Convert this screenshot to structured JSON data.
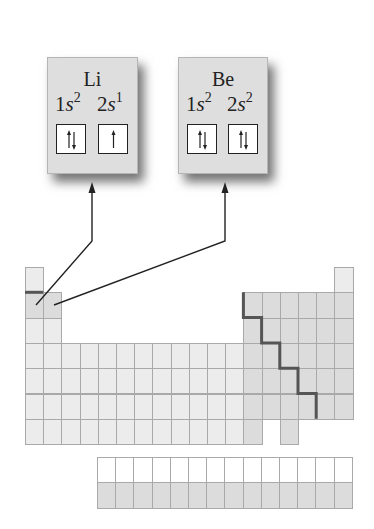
{
  "diagram": {
    "elements": [
      {
        "symbol": "Li",
        "orbitals": [
          {
            "label_n": "1",
            "label_l": "s",
            "electrons": "2",
            "spins": "up-down"
          },
          {
            "label_n": "2",
            "label_l": "s",
            "electrons": "1",
            "spins": "up"
          }
        ],
        "table_position": {
          "period": 2,
          "group": 1
        }
      },
      {
        "symbol": "Be",
        "orbitals": [
          {
            "label_n": "1",
            "label_l": "s",
            "electrons": "2",
            "spins": "up-down"
          },
          {
            "label_n": "2",
            "label_l": "s",
            "electrons": "2",
            "spins": "up-down"
          }
        ],
        "table_position": {
          "period": 2,
          "group": 2
        }
      }
    ],
    "periodic_table": {
      "main_periods": 7,
      "groups": 18,
      "highlighted_cells": [
        "Li",
        "Be"
      ],
      "metal_nonmetal_staircase": true,
      "f_block_rows": 2,
      "f_block_columns": 14
    },
    "colors": {
      "box_fill": "#dedede",
      "cell_fill": "#ececec",
      "cell_highlight": "#dcdcdc",
      "cell_border": "#a9a9a9",
      "staircase": "#555555",
      "arrow": "#222222"
    }
  }
}
